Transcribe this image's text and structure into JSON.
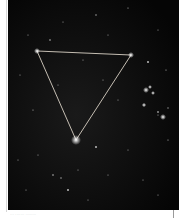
{
  "image": {
    "subject": "starfield with triangle asterism",
    "background_color": "#060606",
    "line_color": "#d8d0c4",
    "stars_marked": [
      {
        "name": "top-left-star",
        "x": 29,
        "y": 51
      },
      {
        "name": "top-right-star",
        "x": 123,
        "y": 55
      },
      {
        "name": "bottom-star",
        "x": 68,
        "y": 140
      }
    ],
    "cluster_region": "right side, mid-height"
  },
  "caption": {
    "text": "··· ······· ········"
  }
}
